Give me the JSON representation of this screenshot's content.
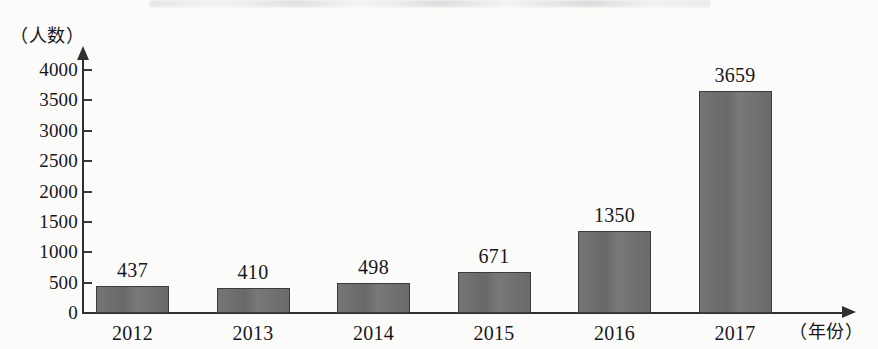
{
  "chart_data": {
    "type": "bar",
    "title": "",
    "subtitle": "",
    "xlabel": "（年份）",
    "ylabel": "（人数）",
    "categories": [
      "2012",
      "2013",
      "2014",
      "2015",
      "2016",
      "2017"
    ],
    "values": [
      437,
      410,
      498,
      671,
      1350,
      3659
    ],
    "value_labels": [
      "437",
      "410",
      "498",
      "671",
      "1350",
      "3659"
    ],
    "ylim": [
      0,
      4000
    ],
    "ytick_values": [
      0,
      500,
      1000,
      1500,
      2000,
      2500,
      3000,
      3500,
      4000
    ],
    "ytick_labels": [
      "0",
      "500",
      "1000",
      "1500",
      "2000",
      "2500",
      "3000",
      "3500",
      "4000"
    ],
    "grid": false,
    "legend": null,
    "legend_position": "none",
    "bar_color": "#6e6e6e",
    "bar_edge_color": "#3c3c3c",
    "axis_color": "#30302f",
    "background_color": "#fbfbfa",
    "y_axis_has_arrow": true,
    "x_axis_has_arrow": true
  }
}
